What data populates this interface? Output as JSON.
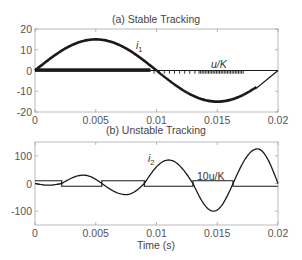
{
  "chart_data": [
    {
      "type": "line",
      "title": "(a) Stable Tracking",
      "xlabel": "",
      "ylabel": "",
      "xlim": [
        0,
        0.02
      ],
      "ylim": [
        -20,
        20
      ],
      "xticks": [
        0,
        0.005,
        0.01,
        0.015,
        0.02
      ],
      "xtick_labels": [
        "0",
        "0.005",
        "0.01",
        "0.015",
        "0.02"
      ],
      "yticks": [
        20,
        10,
        0,
        -10,
        -20
      ],
      "ytick_labels": [
        "20",
        "10",
        "0",
        "-10",
        "-20"
      ],
      "grid": false,
      "series": [
        {
          "name": "i1",
          "label_main": "i",
          "label_sub": "1",
          "description": "sinusoidal current, amplitude ~15, period 0.02 s, with chattering in second half",
          "x": [
            0,
            0.001,
            0.002,
            0.003,
            0.004,
            0.005,
            0.006,
            0.007,
            0.008,
            0.009,
            0.01,
            0.011,
            0.012,
            0.013,
            0.014,
            0.015,
            0.016,
            0.017,
            0.018,
            0.019,
            0.02
          ],
          "values": [
            0,
            4.6,
            8.8,
            12.1,
            14.3,
            15,
            14.3,
            12.1,
            8.8,
            4.6,
            0,
            -4.6,
            -8.8,
            -12.1,
            -14.3,
            -15,
            -14.3,
            -12.1,
            -8.8,
            -4.4,
            0
          ]
        },
        {
          "name": "u/K",
          "label": "u/K",
          "description": "switching control, dense chattering between 0 and ~1",
          "values_range": [
            0,
            1
          ]
        }
      ],
      "annotations": [
        {
          "text": "i1",
          "x": 0.0083,
          "y": 9
        },
        {
          "text": "u/K",
          "x": 0.0155,
          "y": 2
        }
      ]
    },
    {
      "type": "line",
      "title": "(b) Unstable Tracking",
      "xlabel": "Time (s)",
      "ylabel": "",
      "xlim": [
        0,
        0.02
      ],
      "ylim": [
        -150,
        150
      ],
      "xticks": [
        0,
        0.005,
        0.01,
        0.015,
        0.02
      ],
      "xtick_labels": [
        "0",
        "0.005",
        "0.01",
        "0.015",
        "0.02"
      ],
      "yticks": [
        100,
        0,
        -100
      ],
      "ytick_labels": [
        "100",
        "0",
        "-100"
      ],
      "grid": false,
      "series": [
        {
          "name": "i2",
          "label_main": "i",
          "label_sub": "2",
          "description": "growing oscillation",
          "zero_crossings": [
            0.0022,
            0.0055,
            0.009,
            0.013,
            0.0163,
            0.02
          ],
          "peaks": [
            {
              "x": 0.004,
              "y": 30
            },
            {
              "x": 0.0075,
              "y": -40
            },
            {
              "x": 0.011,
              "y": 85
            },
            {
              "x": 0.0147,
              "y": -100
            },
            {
              "x": 0.0183,
              "y": 125
            }
          ]
        },
        {
          "name": "10u/K",
          "label": "10u/K",
          "description": "square wave ±10 switching at i2 zero crossings",
          "levels": [
            10,
            -10
          ],
          "switch_times": [
            0.0022,
            0.0055,
            0.009,
            0.013,
            0.0163,
            0.02
          ],
          "segments": [
            {
              "from": 0,
              "to": 0.0022,
              "value": 10
            },
            {
              "from": 0.0022,
              "to": 0.0055,
              "value": -10
            },
            {
              "from": 0.0055,
              "to": 0.009,
              "value": 10
            },
            {
              "from": 0.009,
              "to": 0.013,
              "value": -10
            },
            {
              "from": 0.013,
              "to": 0.0163,
              "value": 10
            },
            {
              "from": 0.0163,
              "to": 0.02,
              "value": -10
            }
          ]
        }
      ],
      "annotations": [
        {
          "text": "i2",
          "x": 0.0092,
          "y": 75
        },
        {
          "text": "10u/K",
          "x": 0.0135,
          "y": 18
        }
      ]
    }
  ],
  "colors": {
    "line": "#1a1a1a",
    "axis": "#999999",
    "text": "#555555"
  }
}
